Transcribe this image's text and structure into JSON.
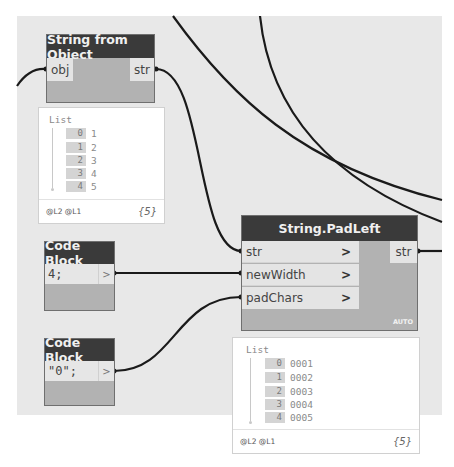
{
  "nodes": {
    "string_from_object": {
      "title": "String from Object",
      "input_port": "obj",
      "output_port": "str"
    },
    "pad_left": {
      "title": "String.PadLeft",
      "inputs": [
        "str",
        "newWidth",
        "padChars"
      ],
      "input_chevron": ">",
      "output_port": "str",
      "lacing": "AUTO"
    },
    "code_block_1": {
      "title": "Code Block",
      "code": "4;",
      "output_port": ">"
    },
    "code_block_2": {
      "title": "Code Block",
      "code": "\"0\";",
      "output_port": ">"
    }
  },
  "previews": {
    "string_from_object": {
      "title": "List",
      "items": [
        {
          "index": "0",
          "value": "1"
        },
        {
          "index": "1",
          "value": "2"
        },
        {
          "index": "2",
          "value": "3"
        },
        {
          "index": "3",
          "value": "4"
        },
        {
          "index": "4",
          "value": "5"
        }
      ],
      "levels": "@L2 @L1",
      "count": "{5}"
    },
    "pad_left": {
      "title": "List",
      "items": [
        {
          "index": "0",
          "value": "0001"
        },
        {
          "index": "1",
          "value": "0002"
        },
        {
          "index": "2",
          "value": "0003"
        },
        {
          "index": "3",
          "value": "0004"
        },
        {
          "index": "4",
          "value": "0005"
        }
      ],
      "levels": "@L2 @L1",
      "count": "{5}"
    }
  },
  "colors": {
    "canvas": "#e8e8e8",
    "node_header": "#3a3a3a",
    "node_body": "#b2b2b2",
    "port": "#e4e4e4",
    "wire": "#1a1a1a"
  }
}
